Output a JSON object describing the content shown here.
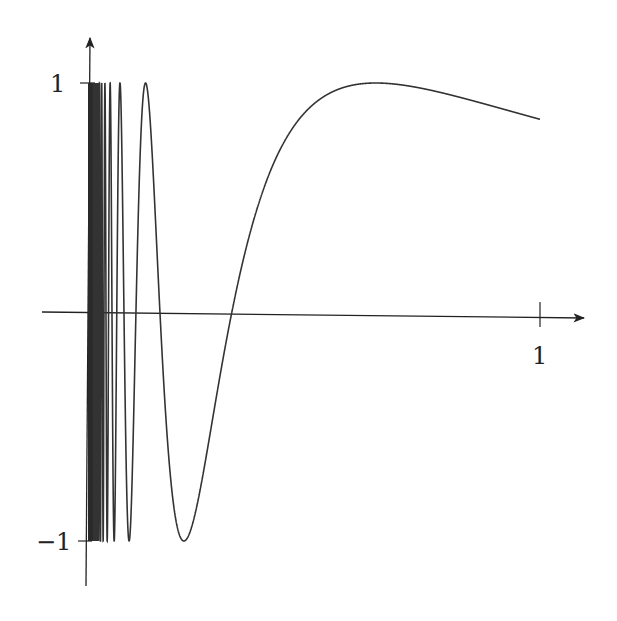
{
  "chart_data": {
    "type": "line",
    "title": "",
    "function": "sin(1/x)",
    "xlabel": "",
    "ylabel": "",
    "xlim": [
      0,
      1
    ],
    "ylim": [
      -1,
      1
    ],
    "grid": false,
    "legend": null,
    "x_ticks": [
      {
        "value": 1,
        "label": "1"
      }
    ],
    "y_ticks": [
      {
        "value": 1,
        "label": "1"
      },
      {
        "value": -1,
        "label": "−1"
      }
    ],
    "series": [
      {
        "name": "sin(1/x)",
        "color": "#333333",
        "sample_points": [
          {
            "x": 0.1,
            "y": -0.544
          },
          {
            "x": 0.2122,
            "y": -1.0
          },
          {
            "x": 0.3183,
            "y": 0.0
          },
          {
            "x": 0.5,
            "y": 0.909
          },
          {
            "x": 0.6366,
            "y": 1.0
          },
          {
            "x": 0.8,
            "y": 0.949
          },
          {
            "x": 1.0,
            "y": 0.841
          }
        ]
      }
    ]
  },
  "axes": {
    "x_tick_label": "1",
    "y_top_label": "1",
    "y_bottom_label": "−1"
  },
  "colors": {
    "axis": "#222222",
    "curve": "#333333",
    "background": "#ffffff"
  }
}
